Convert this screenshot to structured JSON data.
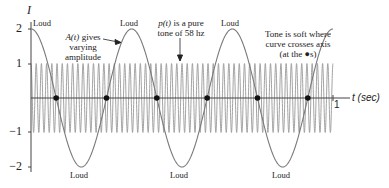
{
  "chart_data": {
    "type": "line",
    "title": "",
    "xlabel": "t (sec)",
    "ylabel": "I",
    "xlim": [
      0,
      1
    ],
    "ylim": [
      -2,
      2
    ],
    "yticks": [
      2,
      1,
      -1,
      -2
    ],
    "ytick_labels": [
      "2",
      "1",
      "−1",
      "−2"
    ],
    "xticks": [
      1
    ],
    "xtick_labels": [
      "1"
    ],
    "grid": false,
    "legend": null,
    "series": [
      {
        "name": "A(t) envelope",
        "description": "Amplitude curve, 3 cycles over 1 sec",
        "formula": "2*cos(2*pi*3*t)",
        "amplitude": 2,
        "frequency_hz": 3,
        "color": "#777777"
      },
      {
        "name": "p(t) pure tone",
        "description": "Pure tone of 58 hz, amplitude 1",
        "formula": "cos(2*pi*58*t)",
        "amplitude": 1,
        "frequency_hz": 58,
        "color": "#999999"
      }
    ],
    "zero_crossings_t": [
      0.0833,
      0.25,
      0.4167,
      0.5833,
      0.75,
      0.9167
    ],
    "annotations": [
      {
        "text": "Loud",
        "t": 0.0,
        "position": "top"
      },
      {
        "text": "Loud",
        "t": 0.1667,
        "position": "bottom"
      },
      {
        "text": "Loud",
        "t": 0.3333,
        "position": "top"
      },
      {
        "text": "Loud",
        "t": 0.5,
        "position": "bottom"
      },
      {
        "text": "Loud",
        "t": 0.6667,
        "position": "top"
      },
      {
        "text": "Loud",
        "t": 0.8333,
        "position": "bottom"
      },
      {
        "text": "A(t) gives varying amplitude",
        "arrow_to": "envelope"
      },
      {
        "text": "p(t) is a pure tone of 58 hz",
        "arrow_to": "tone"
      },
      {
        "text": "Tone is soft where curve crosses axis (at the ●s)"
      }
    ]
  },
  "labels": {
    "y_axis": "I",
    "x_axis": "t (sec)",
    "x_tick_1": "1",
    "y_ticks": [
      "2",
      "1",
      "−1",
      "−2"
    ],
    "loud": "Loud",
    "ann_a_line1_fn": "A(t)",
    "ann_a_line1_rest": " gives",
    "ann_a_line2": "varying",
    "ann_a_line3": "amplitude",
    "ann_p_line1_fn": "p(t)",
    "ann_p_line1_rest": " is a pure",
    "ann_p_line2": "tone of 58 hz",
    "ann_soft_line1": "Tone is soft where",
    "ann_soft_line2": "curve crosses axis",
    "ann_soft_line3": "(at the ●s)"
  },
  "layout": {
    "x0": 31,
    "x1": 333,
    "y_zero": 98,
    "unit_px": 34.5
  }
}
